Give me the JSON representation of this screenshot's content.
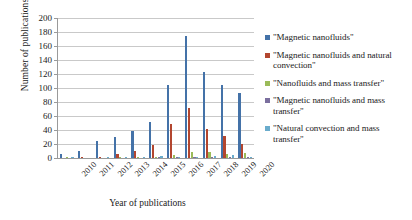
{
  "chart_data": {
    "type": "bar",
    "title": "",
    "xlabel": "Year of publications",
    "ylabel": "Number of publications",
    "ylim": [
      0,
      200
    ],
    "ytick_step": 20,
    "yticks": [
      200,
      180,
      160,
      140,
      120,
      100,
      80,
      60,
      40,
      20,
      0
    ],
    "grid": true,
    "legend_position": "right",
    "categories": [
      "2010",
      "2011",
      "2012",
      "2013",
      "2014",
      "2015",
      "2016",
      "2017",
      "2018",
      "2019",
      "2020"
    ],
    "series": [
      {
        "name": "\"Magnetic nanofluids\"",
        "color": "#4472a8",
        "values": [
          6,
          10,
          24,
          30,
          39,
          52,
          105,
          174,
          123,
          104,
          93
        ]
      },
      {
        "name": "\"Magnetic nanofluids and natural convection\"",
        "color": "#b3462f",
        "values": [
          0,
          1,
          1,
          6,
          10,
          18,
          48,
          72,
          41,
          32,
          20
        ]
      },
      {
        "name": "\"Nanofluids and mass transfer\"",
        "color": "#9bbb59",
        "values": [
          1,
          0,
          0,
          1,
          1,
          2,
          4,
          8,
          8,
          6,
          7
        ]
      },
      {
        "name": "\"Magnetic nanofluids and mass transfer\"",
        "color": "#7b6f9e",
        "values": [
          0,
          0,
          0,
          0,
          0,
          1,
          1,
          2,
          1,
          1,
          1
        ]
      },
      {
        "name": "\"Natural convection and mass transfer\"",
        "color": "#6aaccc",
        "values": [
          1,
          0,
          1,
          2,
          1,
          3,
          2,
          2,
          3,
          4,
          2
        ]
      }
    ]
  },
  "legend": {
    "entries": [
      {
        "label": "\"Magnetic nanofluids\"",
        "color": "#4472a8"
      },
      {
        "label": "\"Magnetic nanofluids and natural convection\"",
        "color": "#b3462f"
      },
      {
        "label": "\"Nanofluids and mass transfer\"",
        "color": "#9bbb59"
      },
      {
        "label": "\"Magnetic nanofluids and mass transfer\"",
        "color": "#7b6f9e"
      },
      {
        "label": "\"Natural convection and mass transfer\"",
        "color": "#6aaccc"
      }
    ]
  }
}
